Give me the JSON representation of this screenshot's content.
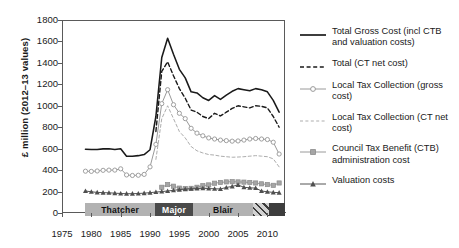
{
  "chart_data": {
    "type": "line",
    "title": "",
    "xlabel": "",
    "ylabel": "£ million (2012–13 values)",
    "xlim": [
      1975,
      2013
    ],
    "ylim": [
      0,
      1800
    ],
    "ytick_labels": [
      "0",
      "200",
      "400",
      "600",
      "800",
      "1000",
      "1200",
      "1400",
      "1600",
      "1800"
    ],
    "ytick_values": [
      0,
      200,
      400,
      600,
      800,
      1000,
      1200,
      1400,
      1600,
      1800
    ],
    "xtick_labels": [
      "1975",
      "1980",
      "1985",
      "1990",
      "1995",
      "2000",
      "2005",
      "2010"
    ],
    "xtick_values": [
      1975,
      1980,
      1985,
      1990,
      1995,
      2000,
      2005,
      2010
    ],
    "grid": false,
    "legend_position": "right",
    "x": [
      1979,
      1980,
      1981,
      1982,
      1983,
      1984,
      1985,
      1986,
      1987,
      1988,
      1989,
      1990,
      1991,
      1992,
      1993,
      1994,
      1995,
      1996,
      1997,
      1998,
      1999,
      2000,
      2001,
      2002,
      2003,
      2004,
      2005,
      2006,
      2007,
      2008,
      2009,
      2010,
      2011,
      2012
    ],
    "series": [
      {
        "name": "Total Gross Cost (incl CTB and valuation costs)",
        "style": "solid",
        "color": "#1a1a1a",
        "marker": "none",
        "values": [
          595,
          592,
          592,
          598,
          600,
          592,
          600,
          530,
          530,
          535,
          545,
          590,
          900,
          1450,
          1630,
          1480,
          1340,
          1260,
          1130,
          1120,
          1075,
          1050,
          1095,
          1060,
          1100,
          1135,
          1160,
          1150,
          1140,
          1160,
          1150,
          1130,
          1050,
          940
        ]
      },
      {
        "name": "Total (CT net cost)",
        "style": "dashed",
        "color": "#1a1a1a",
        "marker": "none",
        "values": [
          null,
          null,
          null,
          null,
          null,
          null,
          null,
          null,
          null,
          null,
          null,
          null,
          760,
          1320,
          1410,
          1280,
          1160,
          1070,
          960,
          940,
          900,
          880,
          930,
          905,
          940,
          975,
          1000,
          990,
          980,
          1000,
          995,
          980,
          900,
          800
        ]
      },
      {
        "name": "Local Tax Collection (gross cost)",
        "style": "solid",
        "color": "#9a9a9a",
        "marker": "circle-open",
        "values": [
          390,
          388,
          392,
          398,
          400,
          400,
          412,
          355,
          350,
          352,
          360,
          430,
          640,
          1020,
          1150,
          1010,
          930,
          880,
          790,
          745,
          720,
          700,
          690,
          680,
          675,
          670,
          672,
          680,
          690,
          695,
          690,
          685,
          660,
          550
        ]
      },
      {
        "name": "Local Tax Collection (CT net cost)",
        "style": "dashed",
        "color": "#adadad",
        "marker": "none",
        "values": [
          null,
          null,
          null,
          null,
          null,
          null,
          null,
          null,
          null,
          null,
          null,
          null,
          500,
          880,
          1000,
          880,
          760,
          700,
          620,
          580,
          560,
          545,
          540,
          530,
          525,
          520,
          522,
          525,
          530,
          535,
          530,
          525,
          505,
          430
        ]
      },
      {
        "name": "Council Tax Benefit (CTB) administration cost",
        "style": "solid",
        "color": "#9a9a9a",
        "marker": "square",
        "values": [
          null,
          null,
          null,
          null,
          null,
          null,
          null,
          null,
          null,
          null,
          null,
          null,
          null,
          240,
          265,
          250,
          232,
          228,
          230,
          240,
          255,
          262,
          278,
          285,
          290,
          292,
          290,
          288,
          285,
          280,
          272,
          265,
          258,
          280
        ]
      },
      {
        "name": "Valuation costs",
        "style": "solid",
        "color": "#555555",
        "marker": "triangle",
        "values": [
          205,
          198,
          192,
          190,
          188,
          185,
          182,
          180,
          180,
          182,
          185,
          190,
          195,
          200,
          205,
          212,
          218,
          222,
          226,
          228,
          230,
          228,
          226,
          224,
          238,
          248,
          262,
          240,
          235,
          232,
          205,
          198,
          192,
          190
        ]
      }
    ],
    "bands": [
      {
        "label": "Thatcher",
        "start": 1979,
        "end": 1990.8,
        "fill": "#b2b2b2",
        "text_color": "#111111",
        "hatched": false
      },
      {
        "label": "Major",
        "start": 1990.8,
        "end": 1997.4,
        "fill": "#4a4a4a",
        "text_color": "#ffffff",
        "hatched": false
      },
      {
        "label": "Blair",
        "start": 1997.4,
        "end": 2007.5,
        "fill": "#b2b2b2",
        "text_color": "#111111",
        "hatched": false
      },
      {
        "label": "",
        "start": 2007.5,
        "end": 2010.3,
        "fill": "#c8c8c8",
        "text_color": "#111111",
        "hatched": true
      },
      {
        "label": "",
        "start": 2010.3,
        "end": 2013,
        "fill": "#3d3d3d",
        "text_color": "#ffffff",
        "hatched": false
      }
    ]
  },
  "legend": {
    "items": [
      {
        "label": "Total Gross Cost (incl CTB and valuation costs)"
      },
      {
        "label": "Total (CT net cost)"
      },
      {
        "label": "Local Tax Collection (gross cost)"
      },
      {
        "label": "Local Tax Collection (CT net cost)"
      },
      {
        "label": "Council Tax Benefit (CTB) administration cost"
      },
      {
        "label": "Valuation costs"
      }
    ]
  }
}
